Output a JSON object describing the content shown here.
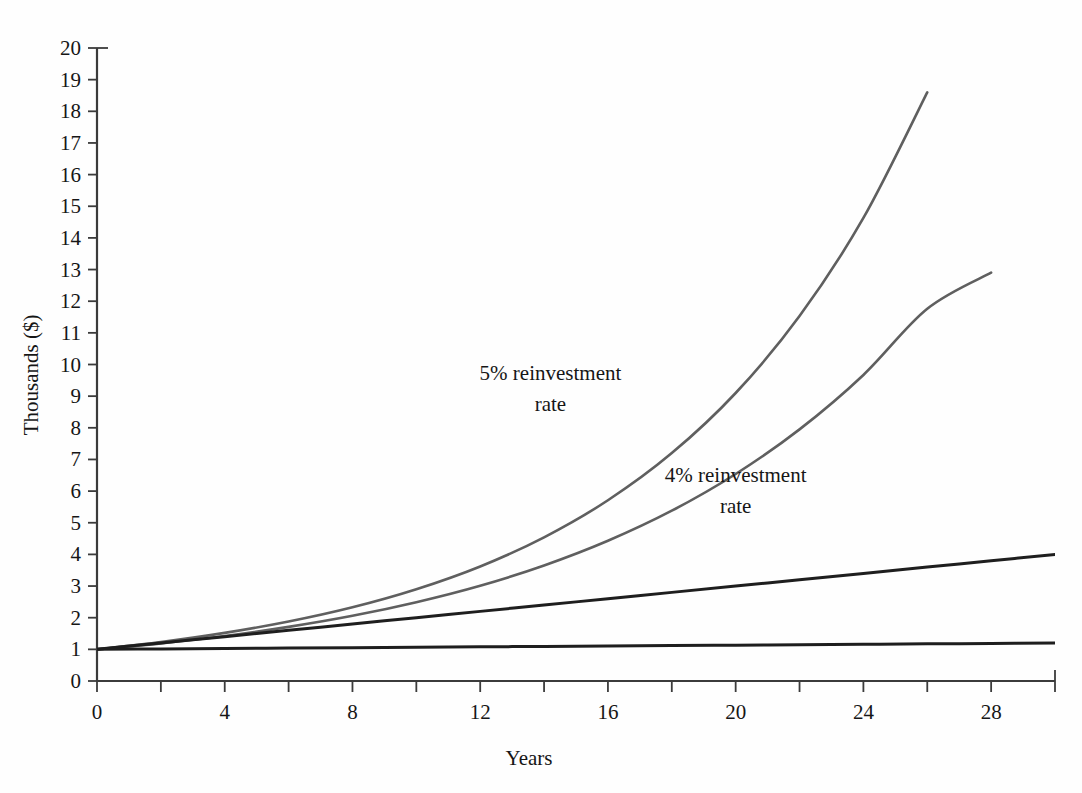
{
  "chart_data": {
    "type": "line",
    "title": "",
    "subtitle": "",
    "xlabel": "Years",
    "ylabel": "Thousands ($)",
    "xlim": [
      0,
      30
    ],
    "ylim": [
      0,
      20
    ],
    "grid": false,
    "legend_position": "inline-annotations",
    "x_tick_labels": [
      "0",
      "4",
      "8",
      "12",
      "16",
      "20",
      "24",
      "28"
    ],
    "x_tick_values": [
      0,
      4,
      8,
      12,
      16,
      20,
      24,
      28
    ],
    "x_minor_tick_values": [
      0,
      2,
      4,
      6,
      8,
      10,
      12,
      14,
      16,
      18,
      20,
      22,
      24,
      26,
      28,
      30
    ],
    "y_tick_labels": [
      "0",
      "1",
      "2",
      "3",
      "4",
      "5",
      "6",
      "7",
      "8",
      "9",
      "10",
      "11",
      "12",
      "13",
      "14",
      "15",
      "16",
      "17",
      "18",
      "19",
      "20"
    ],
    "y_tick_values": [
      0,
      1,
      2,
      3,
      4,
      5,
      6,
      7,
      8,
      9,
      10,
      11,
      12,
      13,
      14,
      15,
      16,
      17,
      18,
      19,
      20
    ],
    "x": [
      0,
      2,
      4,
      6,
      8,
      10,
      12,
      14,
      16,
      18,
      20,
      22,
      24,
      26,
      28,
      30
    ],
    "series": [
      {
        "name": "5% reinvestment rate",
        "color": "#5f5f5f",
        "width": 2.6,
        "values": [
          1.0,
          1.23,
          1.52,
          1.88,
          2.33,
          2.9,
          3.62,
          4.54,
          5.71,
          7.2,
          9.1,
          11.53,
          14.63,
          18.6,
          23.66,
          30.1
        ],
        "values_clipped": [
          1.0,
          1.23,
          1.52,
          1.88,
          2.33,
          2.9,
          3.62,
          4.54,
          5.71,
          7.2,
          9.1,
          11.53,
          14.63,
          18.6
        ]
      },
      {
        "name": "4% reinvestment rate",
        "color": "#5f5f5f",
        "width": 2.6,
        "values": [
          1.0,
          1.19,
          1.42,
          1.71,
          2.06,
          2.49,
          3.01,
          3.65,
          4.43,
          5.38,
          6.54,
          7.95,
          9.67,
          11.76,
          14.3,
          17.4
        ],
        "values_clipped": [
          1.0,
          1.19,
          1.42,
          1.71,
          2.06,
          2.49,
          3.01,
          3.65,
          4.43,
          5.38,
          6.54,
          7.95,
          9.67,
          11.76,
          12.9
        ]
      },
      {
        "name": "simple-interest-line",
        "color": "#1e1e1e",
        "width": 3.0,
        "values": [
          1.0,
          1.2,
          1.4,
          1.6,
          1.8,
          2.0,
          2.2,
          2.4,
          2.6,
          2.8,
          3.0,
          3.2,
          3.4,
          3.6,
          3.8,
          4.0
        ]
      },
      {
        "name": "no-reinvestment-line",
        "color": "#1e1e1e",
        "width": 3.0,
        "values": [
          1.0,
          1.013,
          1.027,
          1.04,
          1.053,
          1.067,
          1.08,
          1.093,
          1.107,
          1.12,
          1.133,
          1.147,
          1.16,
          1.173,
          1.187,
          1.2
        ]
      }
    ],
    "annotations": [
      {
        "id": "annotation-5-percent",
        "lines": [
          "5% reinvestment",
          "rate"
        ],
        "x_data": 14.2,
        "y_data": 9.5
      },
      {
        "id": "annotation-4-percent",
        "lines": [
          "4% reinvestment",
          "rate"
        ],
        "x_data": 20.0,
        "y_data": 6.3
      }
    ],
    "axis_color": "#3b3b3b",
    "background_color": "#fefefe"
  }
}
